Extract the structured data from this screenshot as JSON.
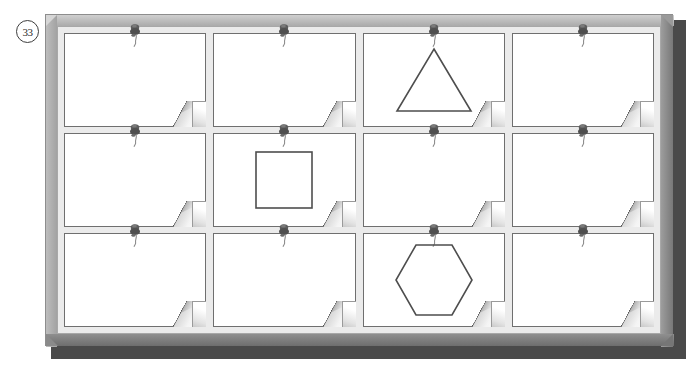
{
  "page": {
    "question_number": "33",
    "background_color": "#ffffff"
  },
  "board": {
    "name": "pin-board",
    "frame_color": "#b9b9b9",
    "panel_color": "#ebebeb",
    "edge_shadow_color": "#4a4a4a",
    "columns": 4,
    "rows": 3,
    "card_count": 12,
    "card_color": "#ffffff",
    "card_border_color": "#6f6f6f",
    "pin_color": "#5e5e5e",
    "shape_stroke_color": "#4e4e4e"
  },
  "cards": [
    {
      "id": "card-r1c1",
      "row": 1,
      "col": 1,
      "shape": "none",
      "pinned": true,
      "curled_corner": true
    },
    {
      "id": "card-r1c2",
      "row": 1,
      "col": 2,
      "shape": "none",
      "pinned": true,
      "curled_corner": true
    },
    {
      "id": "card-r1c3",
      "row": 1,
      "col": 3,
      "shape": "triangle",
      "pinned": true,
      "curled_corner": true
    },
    {
      "id": "card-r1c4",
      "row": 1,
      "col": 4,
      "shape": "none",
      "pinned": true,
      "curled_corner": true
    },
    {
      "id": "card-r2c1",
      "row": 2,
      "col": 1,
      "shape": "none",
      "pinned": true,
      "curled_corner": true
    },
    {
      "id": "card-r2c2",
      "row": 2,
      "col": 2,
      "shape": "square",
      "pinned": true,
      "curled_corner": true
    },
    {
      "id": "card-r2c3",
      "row": 2,
      "col": 3,
      "shape": "none",
      "pinned": true,
      "curled_corner": true
    },
    {
      "id": "card-r2c4",
      "row": 2,
      "col": 4,
      "shape": "none",
      "pinned": true,
      "curled_corner": true
    },
    {
      "id": "card-r3c1",
      "row": 3,
      "col": 1,
      "shape": "none",
      "pinned": true,
      "curled_corner": true
    },
    {
      "id": "card-r3c2",
      "row": 3,
      "col": 2,
      "shape": "none",
      "pinned": true,
      "curled_corner": true
    },
    {
      "id": "card-r3c3",
      "row": 3,
      "col": 3,
      "shape": "hexagon",
      "pinned": true,
      "curled_corner": true
    },
    {
      "id": "card-r3c4",
      "row": 3,
      "col": 4,
      "shape": "none",
      "pinned": true,
      "curled_corner": true
    }
  ],
  "icons": {
    "pin": "push-pin-icon",
    "curl": "page-curl-icon",
    "triangle": "triangle-shape",
    "square": "square-shape",
    "hexagon": "hexagon-shape"
  }
}
